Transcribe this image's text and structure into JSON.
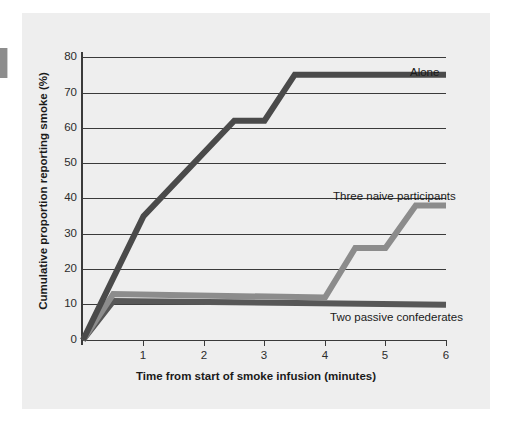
{
  "figure": {
    "background_color": "#eeeeee",
    "page_color": "#ffffff"
  },
  "chart_data": {
    "type": "line",
    "title": "",
    "subtitle": "",
    "xlabel": "Time from start of smoke infusion (minutes)",
    "ylabel": "Cumulative proportion reporting smoke (%)",
    "xlim": [
      0,
      6
    ],
    "ylim": [
      0,
      80
    ],
    "xticks": [
      1,
      2,
      3,
      4,
      5,
      6
    ],
    "xtick_labels": [
      "1",
      "2",
      "3",
      "4",
      "5",
      "6"
    ],
    "yticks": [
      0,
      10,
      20,
      30,
      40,
      50,
      60,
      70,
      80
    ],
    "ytick_labels": [
      "0",
      "10",
      "20",
      "30",
      "40",
      "50",
      "60",
      "70",
      "80"
    ],
    "grid": "horizontal",
    "legend_position": "inline-annotations",
    "series": [
      {
        "name": "Alone",
        "color": "#4a4a4a",
        "x": [
          0,
          1,
          2.5,
          3,
          3.5,
          6
        ],
        "values": [
          0,
          35,
          62,
          62,
          75,
          75
        ]
      },
      {
        "name": "Three naive participants",
        "color": "#8c8c8c",
        "x": [
          0,
          0.5,
          4,
          4.5,
          5,
          5.5,
          6
        ],
        "values": [
          0,
          13,
          12,
          26,
          26,
          38,
          38
        ]
      },
      {
        "name": "Two passive confederates",
        "color": "#575757",
        "x": [
          0,
          0.5,
          6
        ],
        "values": [
          0,
          11,
          10
        ]
      }
    ],
    "annotations": [
      {
        "text": "Alone",
        "series": "Alone"
      },
      {
        "text": "Three naive participants",
        "series": "Three naive participants"
      },
      {
        "text": "Two passive confederates",
        "series": "Two passive confederates"
      }
    ]
  },
  "axis": {
    "ytick_0": "0",
    "ytick_10": "10",
    "ytick_20": "20",
    "ytick_30": "30",
    "ytick_40": "40",
    "ytick_50": "50",
    "ytick_60": "60",
    "ytick_70": "70",
    "ytick_80": "80",
    "xtick_1": "1",
    "xtick_2": "2",
    "xtick_3": "3",
    "xtick_4": "4",
    "xtick_5": "5",
    "xtick_6": "6"
  },
  "labels": {
    "x_title": "Time from start of smoke infusion (minutes)",
    "y_title": "Cumulative proportion reporting smoke (%)",
    "series_alone": "Alone",
    "series_three": "Three naive participants",
    "series_two": "Two passive confederates"
  }
}
